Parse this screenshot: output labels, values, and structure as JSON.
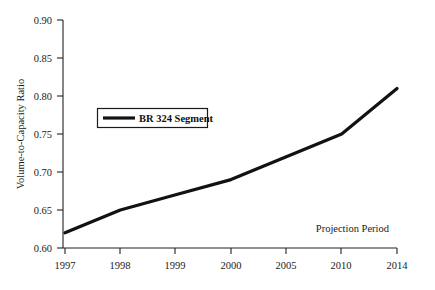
{
  "chart_data": {
    "type": "line",
    "title": "",
    "subtitle": "",
    "xlabel": "",
    "ylabel": "Volume-to-Capacity Ratio",
    "categories": [
      "1997",
      "1998",
      "1999",
      "2000",
      "2005",
      "2010",
      "2014"
    ],
    "series": [
      {
        "name": "BR 324 Segment",
        "values": [
          0.62,
          0.65,
          0.67,
          0.69,
          0.72,
          0.75,
          0.81
        ],
        "color": "#121212"
      }
    ],
    "ylim": [
      0.6,
      0.9
    ],
    "ytick_labels": [
      "0.90",
      "0.85",
      "0.80",
      "0.75",
      "0.70",
      "0.65",
      "0.60"
    ],
    "ytick_values": [
      0.9,
      0.85,
      0.8,
      0.75,
      0.7,
      0.65,
      0.6
    ],
    "grid": false,
    "legend_position": "upper-left-inset",
    "annotations": [
      {
        "text": "Projection Period",
        "position": "lower-right"
      }
    ]
  },
  "legend": {
    "entries": [
      {
        "label": "BR 324 Segment"
      }
    ]
  },
  "axes": {
    "y_title": "Volume-to-Capacity Ratio",
    "y_ticks": [
      "0.90",
      "0.85",
      "0.80",
      "0.75",
      "0.70",
      "0.65",
      "0.60"
    ],
    "x_ticks": [
      "1997",
      "1998",
      "1999",
      "2000",
      "2005",
      "2010",
      "2014"
    ]
  },
  "annotation": {
    "projection_label": "Projection Period"
  }
}
